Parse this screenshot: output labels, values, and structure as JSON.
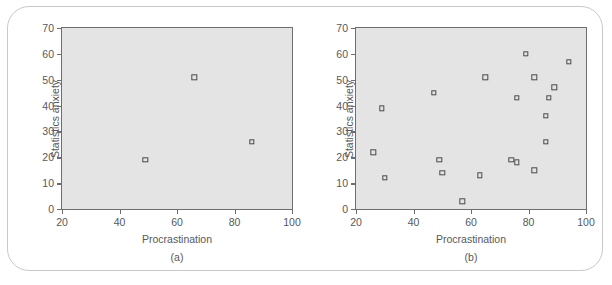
{
  "figure": {
    "background_color": "#ffffff",
    "frame_color": "#c9c9c9",
    "plot_background_color": "#e4e4e4",
    "axis_color": "#6d6d6d",
    "marker_color": "#4a4a4c",
    "text_color": "#58585a"
  },
  "chart_data": [
    {
      "type": "scatter",
      "title": "",
      "caption": "(a)",
      "xlabel": "Procrastination",
      "ylabel": "Statistics anxiety",
      "xlim": [
        20,
        100
      ],
      "ylim": [
        0,
        70
      ],
      "xticks": [
        20,
        40,
        60,
        80,
        100
      ],
      "yticks": [
        0,
        10,
        20,
        30,
        40,
        50,
        60,
        70
      ],
      "xticklabels": [
        "20",
        "40",
        "60",
        "80",
        "100"
      ],
      "yticklabels": [
        "0",
        "10",
        "20",
        "30",
        "40",
        "50",
        "60",
        "70"
      ],
      "grid": false,
      "legend": false,
      "marker": "open-square",
      "points": [
        {
          "x": 49,
          "y": 19
        },
        {
          "x": 66,
          "y": 51
        },
        {
          "x": 86,
          "y": 26
        }
      ]
    },
    {
      "type": "scatter",
      "title": "",
      "caption": "(b)",
      "xlabel": "Procrastination",
      "ylabel": "Statistics anxiety",
      "xlim": [
        20,
        100
      ],
      "ylim": [
        0,
        70
      ],
      "xticks": [
        20,
        40,
        60,
        80,
        100
      ],
      "yticks": [
        0,
        10,
        20,
        30,
        40,
        50,
        60,
        70
      ],
      "xticklabels": [
        "20",
        "40",
        "60",
        "80",
        "100"
      ],
      "yticklabels": [
        "0",
        "10",
        "20",
        "30",
        "40",
        "50",
        "60",
        "70"
      ],
      "grid": false,
      "legend": false,
      "marker": "open-square",
      "points": [
        {
          "x": 26,
          "y": 22
        },
        {
          "x": 29,
          "y": 39
        },
        {
          "x": 30,
          "y": 12
        },
        {
          "x": 47,
          "y": 45
        },
        {
          "x": 49,
          "y": 19
        },
        {
          "x": 50,
          "y": 14
        },
        {
          "x": 57,
          "y": 3
        },
        {
          "x": 63,
          "y": 13
        },
        {
          "x": 65,
          "y": 51
        },
        {
          "x": 74,
          "y": 19
        },
        {
          "x": 76,
          "y": 18
        },
        {
          "x": 76,
          "y": 43
        },
        {
          "x": 79,
          "y": 60
        },
        {
          "x": 82,
          "y": 15
        },
        {
          "x": 82,
          "y": 51
        },
        {
          "x": 86,
          "y": 26
        },
        {
          "x": 86,
          "y": 36
        },
        {
          "x": 87,
          "y": 43
        },
        {
          "x": 89,
          "y": 47
        },
        {
          "x": 94,
          "y": 57
        }
      ]
    }
  ]
}
